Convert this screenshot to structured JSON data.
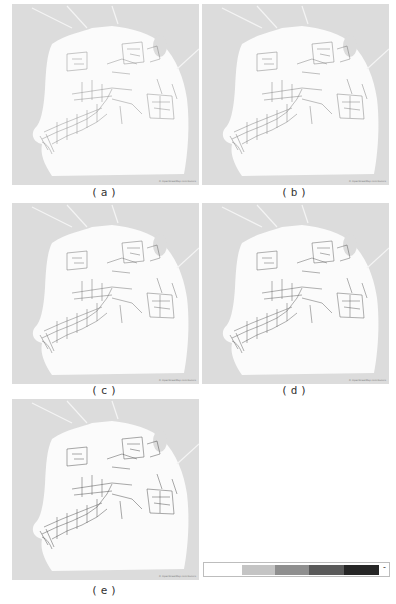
{
  "figure": {
    "panels": [
      {
        "id": "a",
        "caption": "(a)",
        "attribution": "© OpenStreetMap contributors",
        "left": 12,
        "top": 4,
        "captionTop": 186
      },
      {
        "id": "b",
        "caption": "(b)",
        "attribution": "© OpenStreetMap contributors",
        "left": 202,
        "top": 4,
        "captionTop": 186
      },
      {
        "id": "c",
        "caption": "(c)",
        "attribution": "© OpenStreetMap contributors",
        "left": 12,
        "top": 203,
        "captionTop": 384
      },
      {
        "id": "d",
        "caption": "(d)",
        "attribution": "© OpenStreetMap contributors",
        "left": 202,
        "top": 203,
        "captionTop": 384
      },
      {
        "id": "e",
        "caption": "(e)",
        "attribution": "© OpenStreetMap contributors",
        "left": 12,
        "top": 399,
        "captionTop": 584
      }
    ],
    "colors": {
      "water": "#dcdcdc",
      "land": "#fbfbfb",
      "roads": "#3a3a3a",
      "park": "#e6e6e6"
    },
    "legend": {
      "bands": [
        {
          "color": "#ffffff",
          "left": 1,
          "width": 37
        },
        {
          "color": "#c4c4c4",
          "left": 38,
          "width": 33
        },
        {
          "color": "#8f8f8f",
          "left": 71,
          "width": 34
        },
        {
          "color": "#5a5a5a",
          "left": 105,
          "width": 35
        },
        {
          "color": "#262626",
          "left": 140,
          "width": 35
        }
      ],
      "end_symbol": "-"
    }
  }
}
